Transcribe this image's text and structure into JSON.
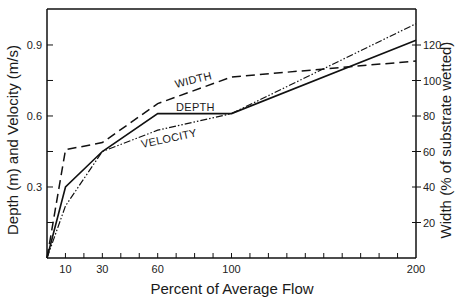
{
  "chart_data": {
    "type": "line",
    "title": "",
    "xlabel": "Percent of Average Flow",
    "ylabel": "Depth (m) and Velocity (m/s)",
    "ylabel_right": "Width (% of substrate wetted)",
    "xlim": [
      0,
      200
    ],
    "ylim": [
      0,
      1.05
    ],
    "ylim_right": [
      0,
      140
    ],
    "x_ticks": [
      10,
      30,
      60,
      100,
      200
    ],
    "x_minor_tick_step": 10,
    "y_ticks": [
      "0.3",
      "0.6",
      "0.9"
    ],
    "y_minor_ticks": [
      0.15,
      0.45,
      0.75
    ],
    "y_right_ticks": [
      "20",
      "40",
      "60",
      "80",
      "100",
      "120"
    ],
    "grid": false,
    "legend": "inline labels on curves",
    "x": [
      0,
      10,
      30,
      60,
      100,
      200
    ],
    "series": [
      {
        "name": "DEPTH",
        "axis": "left",
        "unit": "m",
        "style": "solid",
        "values": [
          0,
          0.3,
          0.45,
          0.61,
          0.61,
          0.92
        ]
      },
      {
        "name": "VELOCITY",
        "axis": "left",
        "unit": "m/s",
        "style": "dash-dot-dot",
        "values": [
          0,
          0.22,
          0.45,
          0.54,
          0.61,
          0.99
        ]
      },
      {
        "name": "WIDTH",
        "axis": "right",
        "unit": "% of substrate wetted",
        "style": "dashed",
        "values": [
          0,
          61,
          65,
          87,
          102,
          111
        ]
      }
    ]
  },
  "labels": {
    "x_axis_title": "Percent of Average Flow",
    "y_left_title": "Depth (m) and Velocity (m/s)",
    "y_right_title": "Width (% of substrate wetted)",
    "curve_width": "WIDTH",
    "curve_depth": "DEPTH",
    "curve_velocity": "VELOCITY"
  },
  "colors": {
    "line": "#111111",
    "axis": "#111111",
    "background": "#ffffff"
  }
}
